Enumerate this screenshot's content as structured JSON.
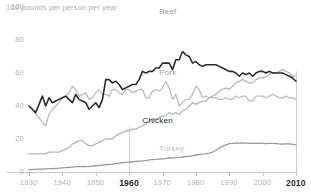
{
  "chart_data": {
    "type": "line",
    "title": "",
    "subtitle": "",
    "unit_note": "100  pounds per person per year",
    "xlabel": "",
    "ylabel": "pounds per person per year",
    "xlim": [
      1930,
      2010
    ],
    "ylim": [
      0,
      100
    ],
    "grid": false,
    "legend_position": "inline-labels",
    "yticks": [
      0,
      20,
      40,
      60,
      80,
      100
    ],
    "ytick_labels": [
      "0",
      "20",
      "40",
      "60",
      "80",
      "100"
    ],
    "xticks": [
      1930,
      1940,
      1950,
      1960,
      1970,
      1980,
      1990,
      2000,
      2010
    ],
    "xtick_labels": [
      "1930",
      "1940",
      "1950",
      "1960",
      "1970",
      "1980",
      "1990",
      "2000",
      "2010"
    ],
    "xticks_emphasized": [
      1960,
      2010
    ],
    "annotations": [
      {
        "name": "marker-line-1960",
        "x": 1960,
        "y_from": 0,
        "y_to": 27
      },
      {
        "name": "marker-line-2010",
        "x": 2010,
        "y_from": 0,
        "y_to": 61
      }
    ],
    "colors": {
      "beef": "#2b2b2b",
      "pork": "#bdbdbd",
      "chicken": "#b6b6b6",
      "turkey": "#9a9a9a",
      "axis": "#c9c9c9",
      "tick_text": "#b4b4b4",
      "tick_text_emphasized": "#2a2a2a"
    },
    "x": [
      1930,
      1931,
      1932,
      1933,
      1934,
      1935,
      1936,
      1937,
      1938,
      1939,
      1940,
      1941,
      1942,
      1943,
      1944,
      1945,
      1946,
      1947,
      1948,
      1949,
      1950,
      1951,
      1952,
      1953,
      1954,
      1955,
      1956,
      1957,
      1958,
      1959,
      1960,
      1961,
      1962,
      1963,
      1964,
      1965,
      1966,
      1967,
      1968,
      1969,
      1970,
      1971,
      1972,
      1973,
      1974,
      1975,
      1976,
      1977,
      1978,
      1979,
      1980,
      1981,
      1982,
      1983,
      1984,
      1985,
      1986,
      1987,
      1988,
      1989,
      1990,
      1991,
      1992,
      1993,
      1994,
      1995,
      1996,
      1997,
      1998,
      1999,
      2000,
      2001,
      2002,
      2003,
      2004,
      2005,
      2006,
      2007,
      2008,
      2009,
      2010
    ],
    "series": [
      {
        "name": "Beef",
        "label": "Beef",
        "color": "#2b2b2b",
        "width": 1.6,
        "label_x": 1972,
        "label_y": 97,
        "values": [
          40,
          38,
          36,
          41,
          46,
          40,
          45,
          42,
          43,
          44,
          45,
          46,
          44,
          42,
          47,
          44,
          43,
          42,
          38,
          40,
          42,
          39,
          44,
          56,
          56,
          54,
          55,
          53,
          50,
          51,
          52,
          53,
          53,
          56,
          61,
          60,
          61,
          61,
          63,
          63,
          66,
          66,
          66,
          62,
          68,
          68,
          73,
          71,
          70,
          66,
          67,
          65,
          64,
          65,
          65,
          65,
          65,
          64,
          63,
          62,
          61,
          61,
          60,
          58,
          60,
          59,
          60,
          58,
          60,
          61,
          61,
          60,
          61,
          60,
          60,
          60,
          60,
          59,
          58,
          57,
          55
        ]
      },
      {
        "name": "Pork",
        "label": "Pork",
        "color": "#bdbdbd",
        "width": 1.3,
        "label_x": 1972,
        "label_y": 60,
        "values": [
          40,
          38,
          35,
          33,
          30,
          28,
          35,
          38,
          40,
          42,
          45,
          46,
          48,
          52,
          50,
          46,
          47,
          48,
          44,
          45,
          48,
          50,
          47,
          47,
          46,
          50,
          50,
          48,
          47,
          50,
          50,
          48,
          49,
          50,
          50,
          45,
          45,
          49,
          50,
          49,
          51,
          55,
          51,
          44,
          47,
          40,
          42,
          44,
          44,
          47,
          52,
          50,
          45,
          46,
          45,
          45,
          45,
          44,
          44,
          45,
          44,
          44,
          46,
          45,
          46,
          46,
          43,
          43,
          46,
          46,
          46,
          45,
          46,
          47,
          46,
          45,
          45,
          46,
          45,
          45,
          44
        ]
      },
      {
        "name": "Chicken",
        "label": "Chicken",
        "color": "#b6b6b6",
        "width": 1.3,
        "label_x": 1967,
        "label_y": 31,
        "values": [
          11,
          11,
          11,
          11,
          11,
          11,
          12,
          12,
          12,
          12,
          13,
          14,
          15,
          17,
          18,
          19,
          19,
          17,
          16,
          16,
          17,
          18,
          19,
          20,
          20,
          20,
          22,
          23,
          24,
          25,
          25,
          26,
          26,
          27,
          28,
          29,
          31,
          32,
          32,
          33,
          34,
          34,
          36,
          35,
          36,
          35,
          37,
          38,
          40,
          42,
          41,
          42,
          43,
          43,
          45,
          46,
          47,
          49,
          50,
          51,
          50,
          52,
          54,
          55,
          56,
          55,
          54,
          54,
          56,
          57,
          57,
          58,
          59,
          60,
          60,
          61,
          62,
          61,
          60,
          58,
          58
        ]
      },
      {
        "name": "Turkey",
        "label": "Turkey",
        "color": "#9a9a9a",
        "width": 1.3,
        "label_x": 1972,
        "label_y": 14,
        "values": [
          1.5,
          1.6,
          1.6,
          1.7,
          1.8,
          1.9,
          2.0,
          2.1,
          2.2,
          2.3,
          2.5,
          2.6,
          2.8,
          3.0,
          3.2,
          3.3,
          3.4,
          3.3,
          3.4,
          3.6,
          3.8,
          4.0,
          4.2,
          4.4,
          4.6,
          4.8,
          5.2,
          5.4,
          5.6,
          5.8,
          6.0,
          6.2,
          6.4,
          6.6,
          6.7,
          6.9,
          7.3,
          7.5,
          7.6,
          7.8,
          8.0,
          8.2,
          8.5,
          8.4,
          8.7,
          8.9,
          9.1,
          9.4,
          9.5,
          9.8,
          10.3,
          10.6,
          10.8,
          11.0,
          11.4,
          12.0,
          13.2,
          14.6,
          15.5,
          16.5,
          17.2,
          17.4,
          17.7,
          17.5,
          17.6,
          17.5,
          17.3,
          17.4,
          17.5,
          17.3,
          17.3,
          17.2,
          17.4,
          17.3,
          17.2,
          17.0,
          16.9,
          17.0,
          17.0,
          16.8,
          16.4
        ]
      }
    ]
  }
}
